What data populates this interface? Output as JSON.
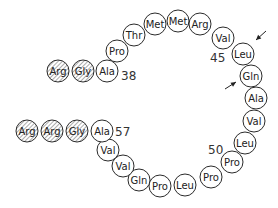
{
  "diagram": {
    "title": "",
    "radius": 11,
    "chains": [
      {
        "name": "upper-chain",
        "residues": [
          {
            "label": "Arg",
            "x": 58,
            "y": 71,
            "shaded": true
          },
          {
            "label": "Gly",
            "x": 83,
            "y": 71,
            "shaded": true
          },
          {
            "label": "Ala",
            "x": 107,
            "y": 71,
            "shaded": false
          },
          {
            "label": "Pro",
            "x": 117,
            "y": 51,
            "shaded": false
          },
          {
            "label": "Thr",
            "x": 134,
            "y": 35,
            "shaded": false
          },
          {
            "label": "Met",
            "x": 155,
            "y": 24,
            "shaded": false
          },
          {
            "label": "Met",
            "x": 178,
            "y": 21,
            "shaded": false
          },
          {
            "label": "Arg",
            "x": 200,
            "y": 24,
            "shaded": false
          },
          {
            "label": "Val",
            "x": 223,
            "y": 38,
            "shaded": false
          },
          {
            "label": "Leu",
            "x": 243,
            "y": 54,
            "shaded": false
          },
          {
            "label": "Gln",
            "x": 251,
            "y": 76,
            "shaded": false
          },
          {
            "label": "Ala",
            "x": 256,
            "y": 98,
            "shaded": false
          },
          {
            "label": "Val",
            "x": 254,
            "y": 121,
            "shaded": false
          },
          {
            "label": "Leu",
            "x": 245,
            "y": 143,
            "shaded": false
          },
          {
            "label": "Pro",
            "x": 232,
            "y": 162,
            "shaded": false
          },
          {
            "label": "Pro",
            "x": 211,
            "y": 177,
            "shaded": false
          },
          {
            "label": "Leu",
            "x": 185,
            "y": 185,
            "shaded": false
          },
          {
            "label": "Pro",
            "x": 160,
            "y": 186,
            "shaded": false
          },
          {
            "label": "Gln",
            "x": 139,
            "y": 180,
            "shaded": false
          },
          {
            "label": "Val",
            "x": 123,
            "y": 166,
            "shaded": false
          },
          {
            "label": "Val",
            "x": 108,
            "y": 150,
            "shaded": false
          },
          {
            "label": "Ala",
            "x": 102,
            "y": 131,
            "shaded": false
          }
        ]
      },
      {
        "name": "lower-chain",
        "residues": [
          {
            "label": "Arg",
            "x": 27,
            "y": 131,
            "shaded": true
          },
          {
            "label": "Arg",
            "x": 52,
            "y": 131,
            "shaded": true
          },
          {
            "label": "Gly",
            "x": 77,
            "y": 131,
            "shaded": true
          }
        ]
      }
    ],
    "position_labels": [
      {
        "text": "38",
        "x": 121,
        "y": 80
      },
      {
        "text": "45",
        "x": 210,
        "y": 62
      },
      {
        "text": "50",
        "x": 208,
        "y": 154
      },
      {
        "text": "57",
        "x": 115,
        "y": 136
      }
    ],
    "arrows": [
      {
        "name": "arrow-leu",
        "x1": 266,
        "y1": 31,
        "x2": 256,
        "y2": 40
      },
      {
        "name": "arrow-gln",
        "x1": 225,
        "y1": 89,
        "x2": 236,
        "y2": 82
      }
    ],
    "colors": {
      "stroke": "#2a2a2a",
      "shade": "#9a9a9a",
      "background": "#ffffff"
    }
  }
}
